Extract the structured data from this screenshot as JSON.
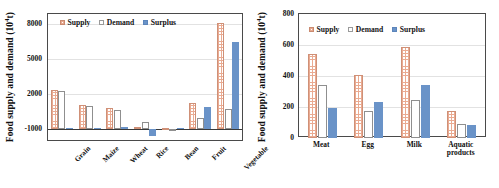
{
  "figure": {
    "panels": [
      {
        "id": "left",
        "ylabel": "Food supply and demand (10",
        "ylabel_exp": "4",
        "ylabel_unit": "t)",
        "legend": [
          {
            "key": "supply",
            "label": "Supply"
          },
          {
            "key": "demand",
            "label": "Demand"
          },
          {
            "key": "surplus",
            "label": "Surplus"
          }
        ],
        "yticks": [
          "8000",
          "5000",
          "2000",
          "-1000"
        ]
      },
      {
        "id": "right",
        "ylabel": "Food supply and demand (10",
        "ylabel_exp": "4",
        "ylabel_unit": "t)",
        "legend": [
          {
            "key": "supply",
            "label": "Supply"
          },
          {
            "key": "demand",
            "label": "Demand"
          },
          {
            "key": "surplus",
            "label": "Surplus"
          }
        ],
        "yticks": [
          "800",
          "600",
          "400",
          "200",
          "0"
        ]
      }
    ]
  },
  "chart_data": [
    {
      "type": "bar",
      "panel": "left",
      "title": "",
      "xlabel": "",
      "ylabel": "Food supply and demand (10^4 t)",
      "ylim": [
        -1000,
        9200
      ],
      "yticks": [
        -1000,
        2000,
        5000,
        8000
      ],
      "grid": true,
      "legend_position": "top-left-inside",
      "categories": [
        "Grain",
        "Maize",
        "Wheat",
        "Rice",
        "Bean",
        "Fruit",
        "Vegetable"
      ],
      "series": [
        {
          "name": "Supply",
          "color": "#eaab92",
          "values": [
            3180,
            1920,
            1700,
            180,
            95,
            2080,
            8500
          ]
        },
        {
          "name": "Demand",
          "color": "#ffffff",
          "values": [
            3060,
            1830,
            1530,
            560,
            60,
            940,
            1640
          ]
        },
        {
          "name": "Surplus",
          "color": "#6a93c8",
          "values": [
            140,
            120,
            160,
            -520,
            90,
            1800,
            7000
          ]
        }
      ]
    },
    {
      "type": "bar",
      "panel": "right",
      "title": "",
      "xlabel": "",
      "ylabel": "Food supply and demand (10^4 t)",
      "ylim": [
        0,
        800
      ],
      "yticks": [
        0,
        200,
        400,
        600,
        800
      ],
      "grid": true,
      "legend_position": "top-left-inside",
      "categories": [
        "Meat",
        "Egg",
        "Milk",
        "Aquatic products"
      ],
      "series": [
        {
          "name": "Supply",
          "color": "#eaab92",
          "values": [
            540,
            404,
            588,
            172
          ]
        },
        {
          "name": "Demand",
          "color": "#ffffff",
          "values": [
            345,
            172,
            248,
            88
          ]
        },
        {
          "name": "Surplus",
          "color": "#6a93c8",
          "values": [
            196,
            232,
            340,
            82
          ]
        }
      ]
    }
  ]
}
